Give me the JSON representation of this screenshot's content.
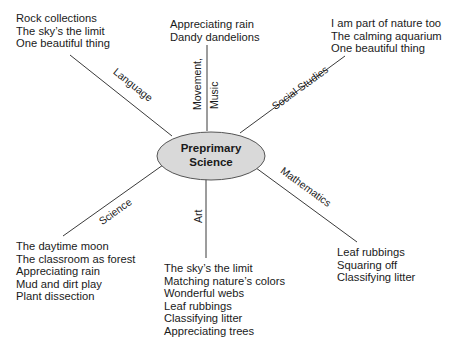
{
  "diagram": {
    "center": {
      "line1": "Preprimary",
      "line2": "Science",
      "fill": "#d9d9d9",
      "stroke": "#555555"
    },
    "branches": [
      {
        "id": "language",
        "label": "Language",
        "items": [
          "Rock collections",
          "The sky’s the limit",
          "One beautiful thing"
        ]
      },
      {
        "id": "movement-music",
        "label_line1": "Movement,",
        "label_line2": "Music",
        "items": [
          "Appreciating rain",
          "Dandy dandelions"
        ]
      },
      {
        "id": "social-studies",
        "label": "Social Studies",
        "items": [
          "I am part of nature too",
          "The calming aquarium",
          "One beautiful thing"
        ]
      },
      {
        "id": "mathematics",
        "label": "Mathematics",
        "items": [
          "Leaf rubbings",
          "Squaring off",
          "Classifying litter"
        ]
      },
      {
        "id": "art",
        "label": "Art",
        "items": [
          "The sky’s the limit",
          "Matching nature’s colors",
          "Wonderful webs",
          "Leaf rubbings",
          "Classifying litter",
          "Appreciating trees"
        ]
      },
      {
        "id": "science",
        "label": "Science",
        "items": [
          "The daytime moon",
          "The classroom as forest",
          "Appreciating rain",
          "Mud and dirt play",
          "Plant dissection"
        ]
      }
    ],
    "line_color": "#3a3a3a"
  }
}
